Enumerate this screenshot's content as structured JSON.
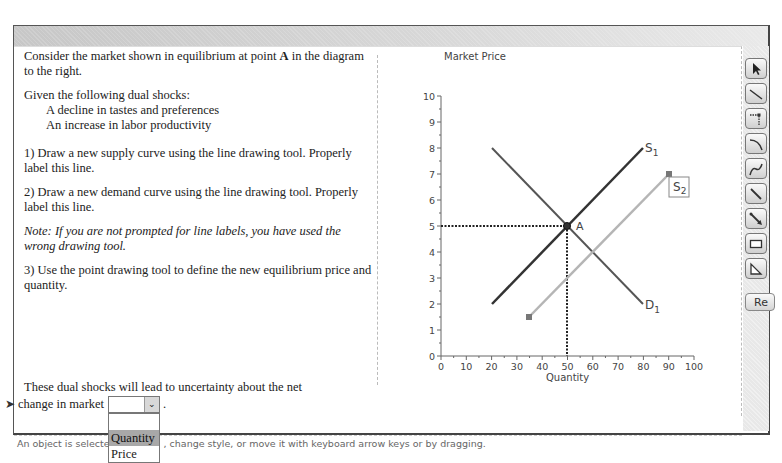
{
  "instructions": {
    "intro": "Consider the market shown in equilibrium at point A in the diagram to the right.",
    "intro_before_bold": "Consider the market shown in equilibrium at point ",
    "intro_bold": "A",
    "intro_after_bold": " in the diagram to the right.",
    "shocks_heading": "Given the following dual shocks:",
    "shocks": [
      "A decline in tastes and preferences",
      "An increase in labor productivity"
    ],
    "step1": "1) Draw a new supply curve using the line drawing tool. Properly label this line.",
    "step2": "2) Draw a new demand curve using the line drawing tool. Properly label this line.",
    "note": "Note: If you are not prompted for line labels, you have used the wrong drawing tool.",
    "step3": "3) Use the point drawing tool to define the new equilibrium price and quantity."
  },
  "question": {
    "line1": "These dual shocks will lead to uncertainty about the net",
    "line2": "change in market",
    "trailing": ".",
    "select": {
      "value": "",
      "options": [
        "",
        "Quantity",
        "Price"
      ],
      "highlighted": "Quantity"
    }
  },
  "status_bar": "An object is selected. Delete it, change style, or move it with keyboard arrow keys or by dragging.",
  "status_visible_left": "An object is selected",
  "status_visible_right": ", change style, or move it with keyboard arrow keys or by dragging.",
  "toolbar": {
    "tools": [
      {
        "name": "select-tool",
        "icon": "arrow-pointer-icon"
      },
      {
        "name": "line-tool",
        "icon": "line-icon"
      },
      {
        "name": "point-tool",
        "icon": "dotted-point-icon"
      },
      {
        "name": "curve-tool",
        "icon": "curve-icon"
      },
      {
        "name": "freehand-tool",
        "icon": "freehand-curve-icon"
      },
      {
        "name": "line-segment-tool",
        "icon": "line-segment-icon"
      },
      {
        "name": "arrow-tool",
        "icon": "arrow-line-icon"
      },
      {
        "name": "rectangle-tool",
        "icon": "rectangle-icon"
      },
      {
        "name": "triangle-tool",
        "icon": "triangle-icon"
      }
    ],
    "reset_label": "Re"
  },
  "chart_data": {
    "type": "line",
    "title": "",
    "ylabel": "Market Price",
    "xlabel": "Quantity",
    "xlim": [
      0,
      100
    ],
    "ylim": [
      0,
      10
    ],
    "x_ticks": [
      0,
      10,
      20,
      30,
      40,
      50,
      60,
      70,
      80,
      90,
      100
    ],
    "y_ticks": [
      0,
      1,
      2,
      3,
      4,
      5,
      6,
      7,
      8,
      9,
      10
    ],
    "grid": false,
    "series": [
      {
        "name": "S1",
        "label": "S",
        "subscript": "1",
        "points": [
          [
            20,
            2
          ],
          [
            80,
            8
          ]
        ],
        "color": "#333333"
      },
      {
        "name": "D1",
        "label": "D",
        "subscript": "1",
        "points": [
          [
            20,
            8
          ],
          [
            80,
            2
          ]
        ],
        "color": "#555555"
      },
      {
        "name": "S2",
        "label": "S",
        "subscript": "2",
        "points": [
          [
            35,
            1.5
          ],
          [
            90,
            7
          ]
        ],
        "color": "#b5b5b5",
        "selected": true
      }
    ],
    "points": [
      {
        "label": "A",
        "x": 50,
        "y": 5
      }
    ],
    "guides": [
      {
        "from": [
          0,
          5
        ],
        "to": [
          50,
          5
        ],
        "style": "dotted"
      },
      {
        "from": [
          50,
          0
        ],
        "to": [
          50,
          5
        ],
        "style": "dotted"
      }
    ]
  }
}
